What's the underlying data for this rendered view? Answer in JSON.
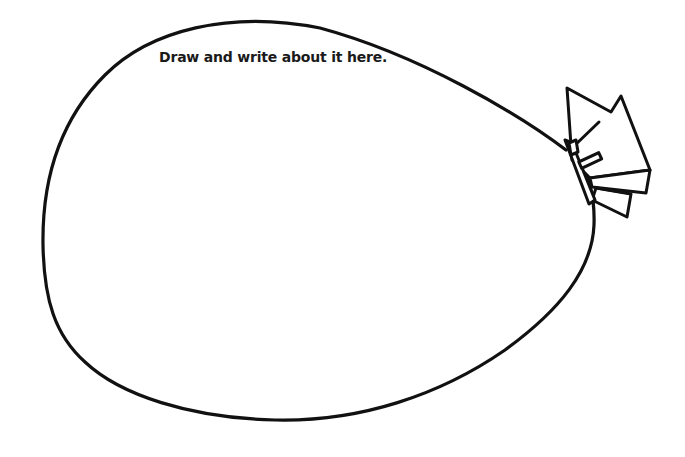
{
  "worksheet": {
    "prompt": "Draw and write about it here.",
    "shape": "balloon-outline",
    "stroke_color": "#111111",
    "background_color": "#ffffff"
  }
}
